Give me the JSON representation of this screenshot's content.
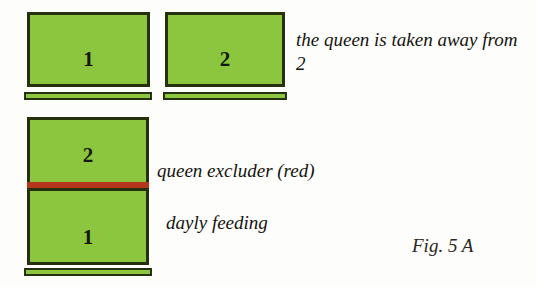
{
  "figure": {
    "caption": "Fig. 5 A",
    "colors": {
      "hive_green": "#8cc63e",
      "hive_border": "#26300f",
      "queen_excluder_red": "#b5351a",
      "background": "#fdfdfb",
      "text": "#15130f"
    }
  },
  "top_row": {
    "left_box": {
      "label": "1"
    },
    "right_box": {
      "label": "2"
    },
    "annotation": "the queen is taken away from 2"
  },
  "lower_stack": {
    "upper_box": {
      "label": "2"
    },
    "lower_box": {
      "label": "1"
    },
    "excluder_annotation": "queen excluder (red)",
    "feeding_annotation": "dayly feeding"
  }
}
